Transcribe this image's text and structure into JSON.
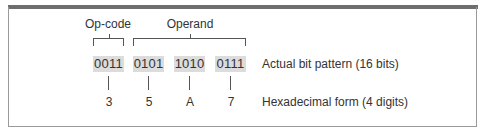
{
  "diagram": {
    "groups": [
      {
        "label": "Op-code",
        "spans_nibbles": [
          0
        ]
      },
      {
        "label": "Operand",
        "spans_nibbles": [
          1,
          2,
          3
        ]
      }
    ],
    "nibbles": [
      {
        "bits": "0011",
        "hex": "3"
      },
      {
        "bits": "0101",
        "hex": "5"
      },
      {
        "bits": "1010",
        "hex": "A"
      },
      {
        "bits": "0111",
        "hex": "7"
      }
    ],
    "row_labels": {
      "bits": "Actual bit pattern (16 bits)",
      "hex": "Hexadecimal form (4 digits)"
    },
    "colors": {
      "top_bar": "#6e6e6e",
      "bit_box_fill": "#dcdcdc",
      "frame": "#9a9a9a",
      "text": "#333333"
    }
  }
}
